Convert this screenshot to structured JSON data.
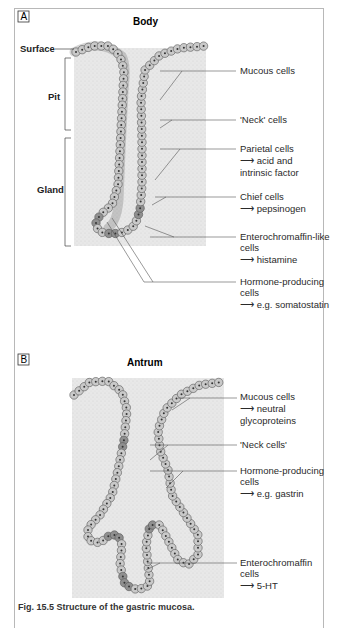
{
  "panels": [
    {
      "letter": "A",
      "title": "Body",
      "side_labels": {
        "surface": "Surface",
        "pit": "Pit",
        "gland": "Gland"
      },
      "labels": [
        {
          "name": "Mucous cells"
        },
        {
          "name": "'Neck' cells"
        },
        {
          "name": "Parietal cells",
          "product": "acid and",
          "product2": "intrinsic factor"
        },
        {
          "name": "Chief cells",
          "product": "pepsinogen"
        },
        {
          "name": "Enterochromaffin-like",
          "name2": "cells",
          "product": "histamine"
        },
        {
          "name": "Hormone-producing",
          "name2": "cells",
          "product": "e.g. somatostatin"
        }
      ]
    },
    {
      "letter": "B",
      "title": "Antrum",
      "labels": [
        {
          "name": "Mucous cells",
          "product": "neutral",
          "product2": "glycoproteins"
        },
        {
          "name": "'Neck cells'"
        },
        {
          "name": "Hormone-producing",
          "name2": "cells",
          "product": "e.g. gastrin"
        },
        {
          "name": "Enterochromaffin",
          "name2": "cells",
          "product": "5-HT"
        }
      ]
    }
  ],
  "arrow_glyph": "⟶",
  "caption": "Fig. 15.5  Structure of the gastric mucosa.",
  "colors": {
    "cell_light": "#c9c9c9",
    "cell_dark": "#8f8f8f",
    "stroma": "#e6e6e6",
    "frame": "#b8b8b8",
    "line": "#555555"
  }
}
